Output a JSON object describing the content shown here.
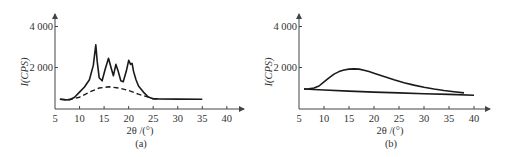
{
  "chart_data": [
    {
      "id": "a",
      "type": "line",
      "caption": "(a)",
      "xlabel": "2θ /(°)",
      "ylabel": "I(CPS)",
      "xlim": [
        5,
        42
      ],
      "ylim": [
        0,
        4500
      ],
      "x_ticks": [
        5,
        10,
        15,
        20,
        25,
        30,
        35,
        40
      ],
      "y_ticks": [
        2000,
        4000
      ],
      "y_tick_labels": [
        "2 000",
        "4 000"
      ],
      "grid": false,
      "series": [
        {
          "name": "measured pattern",
          "style": "solid",
          "x": [
            6,
            7,
            8,
            9,
            10,
            11,
            12,
            12.8,
            13.3,
            13.6,
            14,
            14.6,
            15.2,
            15.9,
            16.4,
            16.9,
            17.4,
            17.9,
            18.4,
            18.9,
            19.5,
            20,
            20.4,
            20.7,
            21.0,
            21.5,
            22,
            23,
            24,
            25,
            26,
            30,
            35
          ],
          "y": [
            450,
            420,
            430,
            550,
            800,
            1050,
            1400,
            2100,
            3100,
            2300,
            1500,
            1350,
            1900,
            2450,
            2000,
            1600,
            2150,
            1800,
            1350,
            1300,
            1800,
            2350,
            2150,
            2200,
            1800,
            1400,
            1100,
            800,
            560,
            480,
            470,
            460,
            450
          ]
        },
        {
          "name": "amorphous background",
          "style": "dashed",
          "x": [
            6,
            8,
            10,
            12,
            14,
            16,
            18,
            20,
            22,
            24,
            25,
            26
          ],
          "y": [
            450,
            440,
            550,
            800,
            1000,
            1060,
            1000,
            880,
            700,
            550,
            470,
            460
          ]
        }
      ]
    },
    {
      "id": "b",
      "type": "line",
      "caption": "(b)",
      "xlabel": "2θ /(°)",
      "ylabel": "I(CPS)",
      "xlim": [
        5,
        42
      ],
      "ylim": [
        0,
        4500
      ],
      "x_ticks": [
        5,
        10,
        15,
        20,
        25,
        30,
        35,
        40
      ],
      "y_ticks": [
        2000,
        4000
      ],
      "y_tick_labels": [
        "2 000",
        "4 000"
      ],
      "grid": false,
      "series": [
        {
          "name": "measured pattern",
          "style": "solid",
          "x": [
            6,
            7,
            8,
            9,
            10,
            11,
            12,
            13,
            14,
            15,
            16,
            17,
            18,
            19,
            20,
            22,
            24,
            26,
            28,
            30,
            32,
            34,
            36,
            38
          ],
          "y": [
            950,
            960,
            1000,
            1100,
            1300,
            1500,
            1680,
            1800,
            1880,
            1920,
            1930,
            1920,
            1870,
            1800,
            1720,
            1560,
            1400,
            1260,
            1140,
            1040,
            950,
            880,
            820,
            760
          ]
        },
        {
          "name": "background baseline",
          "style": "solid",
          "x": [
            6,
            10,
            15,
            20,
            25,
            30,
            35,
            40
          ],
          "y": [
            950,
            900,
            850,
            800,
            760,
            720,
            690,
            650
          ]
        }
      ]
    }
  ]
}
